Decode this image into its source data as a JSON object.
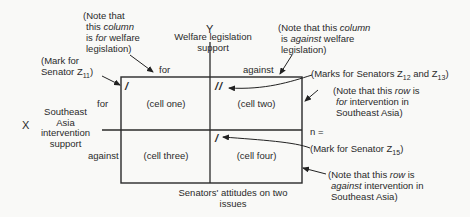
{
  "diagram": {
    "title": "Senators' attitudes on two issues",
    "y_axis": {
      "letter": "Y",
      "label_line1": "Welfare legislation",
      "label_line2": "support",
      "columns": [
        "for",
        "against"
      ]
    },
    "x_axis": {
      "letter": "X",
      "label_lines": [
        "Southeast",
        "Asia",
        "intervention",
        "support"
      ],
      "rows": [
        "for",
        "against"
      ]
    },
    "cells": [
      {
        "id": "cell-one",
        "label": "(cell one)",
        "marks": "/"
      },
      {
        "id": "cell-two",
        "label": "(cell two)",
        "marks": "//"
      },
      {
        "id": "cell-three",
        "label": "(cell three)",
        "marks": ""
      },
      {
        "id": "cell-four",
        "label": "(cell four)",
        "marks": "/"
      }
    ],
    "total_label": "n =",
    "caption_line1": "Senators' attitudes on two",
    "caption_line2": "issues",
    "annotations": {
      "col_for_note": [
        "(Note that",
        "this ",
        "column",
        "is ",
        "for",
        " welfare",
        "legislation)"
      ],
      "col_against_note": [
        "(Note that this ",
        "column",
        "is ",
        "against",
        " welfare",
        "legislation)"
      ],
      "mark_z11": [
        "(Mark for",
        "Senator Z",
        "11",
        ")"
      ],
      "marks_z12_z13": [
        "(Marks for Senators Z",
        "12",
        " and Z",
        "13",
        ")"
      ],
      "row_for_note": [
        "(Note that this ",
        "row",
        " is",
        "for",
        " intervention in",
        "Southeast Asia)"
      ],
      "mark_z15": [
        "(Mark for Senator Z",
        "15",
        ")"
      ],
      "row_against_note": [
        "(Note that this ",
        "row",
        " is",
        "against",
        " intervention in",
        "Southeast Asia)"
      ]
    }
  }
}
